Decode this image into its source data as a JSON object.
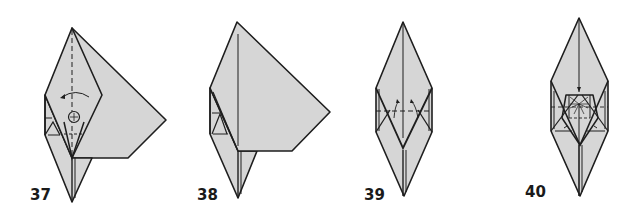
{
  "diagram": {
    "type": "origami-folding-steps",
    "paper_color": "#d6d6d6",
    "line_color": "#1e1e1e",
    "steps": [
      {
        "number": "37",
        "description": "Kite shape with a large flap extending right; curved arrow pointing left at centre, valley-fold dashed line down the middle, circled pivot symbol"
      },
      {
        "number": "38",
        "description": "Flap folded; large flap extends to the right, point at bottom"
      },
      {
        "number": "39",
        "description": "Elongated diamond with horizontal dashed fold line and two small arrows pointing up"
      },
      {
        "number": "40",
        "description": "Elongated diamond with trapezoid squash region, downward arrow at top and radiating crease lines"
      }
    ]
  }
}
